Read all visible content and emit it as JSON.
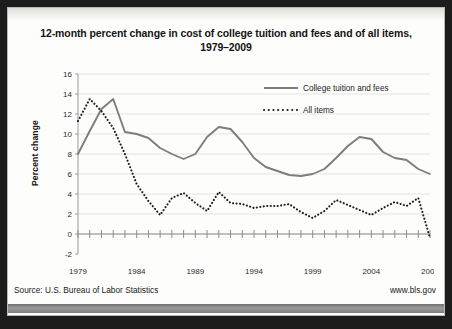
{
  "chart_data": {
    "type": "line",
    "title": "12-month percent change in cost of college tuition and fees and of all items, 1979–2009",
    "title_line1": "12-month percent change in cost of college tuition and fees and of all items,",
    "title_line2": "1979–2009",
    "xlabel": "",
    "ylabel": "Percent change",
    "ylim": [
      -2,
      16
    ],
    "yticks": [
      -2,
      0,
      2,
      4,
      6,
      8,
      10,
      12,
      14,
      16
    ],
    "xlim": [
      1979,
      2009
    ],
    "xticks": [
      1979,
      1984,
      1989,
      1994,
      1999,
      2004,
      2009
    ],
    "xtick_labels": [
      "1979",
      "1984",
      "1989",
      "1994",
      "1999",
      "2004",
      "2009"
    ],
    "grid": "horizontal",
    "legend_position": "top-right",
    "x": [
      1979,
      1980,
      1981,
      1982,
      1983,
      1984,
      1985,
      1986,
      1987,
      1988,
      1989,
      1990,
      1991,
      1992,
      1993,
      1994,
      1995,
      1996,
      1997,
      1998,
      1999,
      2000,
      2001,
      2002,
      2003,
      2004,
      2005,
      2006,
      2007,
      2008,
      2009
    ],
    "series": [
      {
        "name": "College tuition and fees",
        "style": "solid",
        "color": "#7d7d7d",
        "values": [
          8.0,
          10.3,
          12.5,
          13.5,
          10.2,
          10.0,
          9.6,
          8.6,
          8.0,
          7.5,
          8.0,
          9.7,
          10.7,
          10.5,
          9.2,
          7.6,
          6.7,
          6.3,
          5.9,
          5.8,
          6.0,
          6.5,
          7.6,
          8.8,
          9.7,
          9.5,
          8.2,
          7.6,
          7.4,
          6.5,
          6.0
        ]
      },
      {
        "name": "All items",
        "style": "dotted",
        "color": "#1f1f1f",
        "values": [
          11.3,
          13.5,
          12.3,
          10.6,
          8.0,
          5.0,
          3.3,
          1.9,
          3.6,
          4.1,
          3.1,
          2.3,
          4.2,
          3.1,
          3.0,
          2.6,
          2.8,
          2.8,
          3.0,
          2.2,
          1.6,
          2.3,
          3.4,
          2.9,
          2.4,
          1.9,
          2.6,
          3.2,
          2.8,
          3.6,
          -0.4
        ]
      }
    ]
  },
  "legend": {
    "items": [
      {
        "label": "College tuition and fees",
        "style": "solid"
      },
      {
        "label": "All items",
        "style": "dotted"
      }
    ]
  },
  "footer": {
    "source": "Source: U.S. Bureau of Labor Statistics",
    "website": "www.bls.gov"
  }
}
